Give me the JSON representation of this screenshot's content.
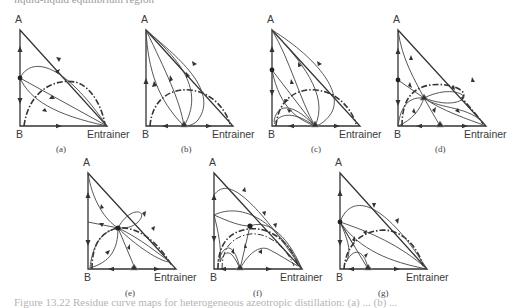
{
  "top_cut_text": "liquid-liquid equilibrium region",
  "vertex_labels": {
    "top": "A",
    "bottom_left": "B",
    "bottom_right": "Entrainer"
  },
  "panels": [
    {
      "id": "a",
      "caption": "(a)"
    },
    {
      "id": "b",
      "caption": "(b)"
    },
    {
      "id": "c",
      "caption": "(c)"
    },
    {
      "id": "d",
      "caption": "(d)"
    },
    {
      "id": "e",
      "caption": "(e)"
    },
    {
      "id": "f",
      "caption": "(f)"
    },
    {
      "id": "g",
      "caption": "(g)"
    }
  ],
  "figure_caption": "Figure 13.22 Residue curve maps for heterogeneous azeotropic distillation: (a) ... (b) ...",
  "legend_semantics": {
    "dash_dot_curve": "liquid-liquid binodal boundary",
    "filled_circle": "binary/ternary azeotrope",
    "triangle_marker": "heterogeneous azeotrope"
  }
}
